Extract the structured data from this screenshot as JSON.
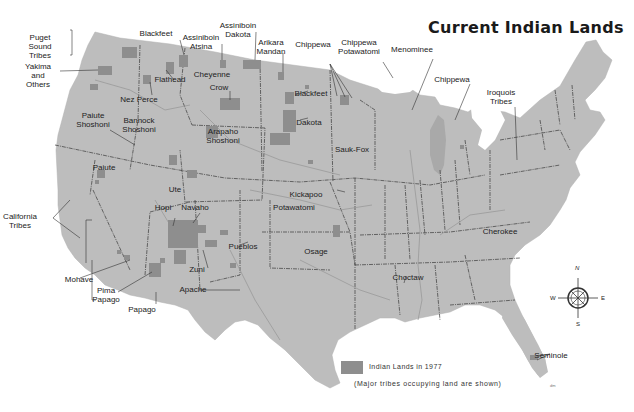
{
  "map": {
    "title": "Current Indian Lands",
    "colors": {
      "background": "#ffffff",
      "land": "#bdbdbd",
      "indian_lands": "#8e8e8e",
      "borders": "#3a3a3a",
      "rivers": "#9a9a9a",
      "text": "#222222"
    },
    "labels": [
      {
        "id": "puget-sound-tribes",
        "text": "Puget\nSound\nTribes",
        "x": 40,
        "y": 33
      },
      {
        "id": "yakima-and-others",
        "text": "Yakima\nand\nOthers",
        "x": 38,
        "y": 62
      },
      {
        "id": "blackfeet-mt",
        "text": "Blackfeet",
        "x": 156,
        "y": 29
      },
      {
        "id": "assiniboin-atsina",
        "text": "Assiniboin\nAtsina",
        "x": 201,
        "y": 33
      },
      {
        "id": "assiniboin-dakota",
        "text": "Assiniboin\nDakota",
        "x": 238,
        "y": 21
      },
      {
        "id": "arikara-mandan",
        "text": "Arikara\nMandan",
        "x": 271,
        "y": 38
      },
      {
        "id": "flathead",
        "text": "Flathead",
        "x": 170,
        "y": 75
      },
      {
        "id": "cheyenne",
        "text": "Cheyenne",
        "x": 212,
        "y": 70
      },
      {
        "id": "crow",
        "text": "Crow",
        "x": 219,
        "y": 83
      },
      {
        "id": "nez-perce",
        "text": "Nez Perce",
        "x": 139,
        "y": 95
      },
      {
        "id": "chippewa-mn",
        "text": "Chippewa",
        "x": 313,
        "y": 40
      },
      {
        "id": "chippewa-potawatomi",
        "text": "Chippewa\nPotawatomi",
        "x": 359,
        "y": 38
      },
      {
        "id": "menominee",
        "text": "Menominee",
        "x": 412,
        "y": 45
      },
      {
        "id": "chippewa-mi",
        "text": "Chippewa",
        "x": 452,
        "y": 75
      },
      {
        "id": "iroquois-tribes",
        "text": "Iroquois\nTribes",
        "x": 501,
        "y": 88
      },
      {
        "id": "blackfeet-sd",
        "text": "Blackfeet",
        "x": 311,
        "y": 89
      },
      {
        "id": "dakota",
        "text": "Dakota",
        "x": 309,
        "y": 118
      },
      {
        "id": "paiute-shoshoni",
        "text": "Paiute\nShoshoni",
        "x": 93,
        "y": 111
      },
      {
        "id": "bannock-shoshoni",
        "text": "Bannock\nShoshoni",
        "x": 139,
        "y": 116
      },
      {
        "id": "arapaho-shoshoni",
        "text": "Arapaho\nShoshoni",
        "x": 223,
        "y": 127
      },
      {
        "id": "sauk-fox",
        "text": "Sauk-Fox",
        "x": 352,
        "y": 145
      },
      {
        "id": "paiute",
        "text": "Paiute",
        "x": 104,
        "y": 163
      },
      {
        "id": "ute",
        "text": "Ute",
        "x": 175,
        "y": 185
      },
      {
        "id": "hopi",
        "text": "Hopi",
        "x": 163,
        "y": 203
      },
      {
        "id": "navaho",
        "text": "Navaho",
        "x": 195,
        "y": 203
      },
      {
        "id": "kickapoo",
        "text": "Kickapoo",
        "x": 306,
        "y": 190
      },
      {
        "id": "potawatomi",
        "text": "Potawatomi",
        "x": 294,
        "y": 203
      },
      {
        "id": "california-tribes",
        "text": "California\nTribes",
        "x": 20,
        "y": 212
      },
      {
        "id": "pueblos",
        "text": "Pueblos",
        "x": 243,
        "y": 242
      },
      {
        "id": "osage",
        "text": "Osage",
        "x": 316,
        "y": 247
      },
      {
        "id": "cherokee",
        "text": "Cherokee",
        "x": 500,
        "y": 227
      },
      {
        "id": "zuni",
        "text": "Zuni",
        "x": 197,
        "y": 265
      },
      {
        "id": "choctaw",
        "text": "Choctaw",
        "x": 408,
        "y": 273
      },
      {
        "id": "mohave",
        "text": "Mohave",
        "x": 79,
        "y": 275
      },
      {
        "id": "apache",
        "text": "Apache",
        "x": 193,
        "y": 285
      },
      {
        "id": "pima-papago",
        "text": "Pima\nPapago",
        "x": 106,
        "y": 286
      },
      {
        "id": "papago",
        "text": "Papago",
        "x": 142,
        "y": 305
      },
      {
        "id": "seminole",
        "text": "Seminole",
        "x": 551,
        "y": 351
      }
    ],
    "compass": {
      "n": "N",
      "s": "S",
      "e": "E",
      "w": "W"
    },
    "legend": {
      "swatch_label": "Indian Lands in 1977",
      "note": "(Major tribes occupying land are shown)"
    },
    "credit": "dm"
  }
}
